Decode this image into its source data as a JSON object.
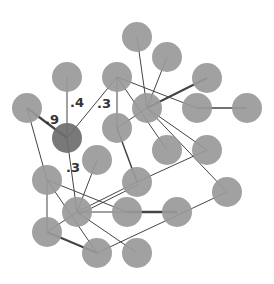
{
  "graph": {
    "node_radius": 15,
    "colors": {
      "node": "#999999",
      "highlight_node": "#6e6e6e",
      "edge": "#444444",
      "label": "#333333"
    },
    "nodes": [
      {
        "id": "n1",
        "x": 137,
        "y": 37
      },
      {
        "id": "n2",
        "x": 167,
        "y": 57
      },
      {
        "id": "n3",
        "x": 207,
        "y": 78
      },
      {
        "id": "n4",
        "x": 67,
        "y": 77
      },
      {
        "id": "n5",
        "x": 117,
        "y": 77
      },
      {
        "id": "n6",
        "x": 27,
        "y": 108
      },
      {
        "id": "n7",
        "x": 147,
        "y": 108
      },
      {
        "id": "n8",
        "x": 197,
        "y": 108
      },
      {
        "id": "n9",
        "x": 247,
        "y": 108
      },
      {
        "id": "n10",
        "x": 67,
        "y": 138,
        "highlight": true
      },
      {
        "id": "n11",
        "x": 117,
        "y": 128
      },
      {
        "id": "n12",
        "x": 167,
        "y": 150
      },
      {
        "id": "n13",
        "x": 207,
        "y": 150
      },
      {
        "id": "n14",
        "x": 97,
        "y": 160
      },
      {
        "id": "n15",
        "x": 47,
        "y": 180
      },
      {
        "id": "n16",
        "x": 137,
        "y": 182
      },
      {
        "id": "n17",
        "x": 227,
        "y": 192
      },
      {
        "id": "n18",
        "x": 77,
        "y": 212
      },
      {
        "id": "n19",
        "x": 127,
        "y": 212
      },
      {
        "id": "n20",
        "x": 177,
        "y": 212
      },
      {
        "id": "n21",
        "x": 47,
        "y": 232
      },
      {
        "id": "n22",
        "x": 97,
        "y": 253
      },
      {
        "id": "n23",
        "x": 137,
        "y": 253
      }
    ],
    "edges": [
      {
        "from": "n6",
        "to": "n10",
        "width": 2.2,
        "label": ".9",
        "lx": 45,
        "ly": 124
      },
      {
        "from": "n4",
        "to": "n10",
        "width": 1,
        "label": ".4",
        "lx": 70,
        "ly": 107
      },
      {
        "from": "n5",
        "to": "n10",
        "width": 1,
        "label": ".3",
        "lx": 97,
        "ly": 108
      },
      {
        "from": "n10",
        "to": "n18",
        "width": 1,
        "label": ".3",
        "lx": 66,
        "ly": 172
      },
      {
        "from": "n6",
        "to": "n15",
        "width": 1
      },
      {
        "from": "n5",
        "to": "n11",
        "width": 1
      },
      {
        "from": "n5",
        "to": "n12",
        "width": 1
      },
      {
        "from": "n5",
        "to": "n8",
        "width": 1
      },
      {
        "from": "n1",
        "to": "n7",
        "width": 1
      },
      {
        "from": "n2",
        "to": "n7",
        "width": 1
      },
      {
        "from": "n3",
        "to": "n7",
        "width": 2
      },
      {
        "from": "n7",
        "to": "n11",
        "width": 1
      },
      {
        "from": "n7",
        "to": "n13",
        "width": 1
      },
      {
        "from": "n7",
        "to": "n17",
        "width": 1
      },
      {
        "from": "n8",
        "to": "n9",
        "width": 1.5
      },
      {
        "from": "n11",
        "to": "n16",
        "width": 1.5
      },
      {
        "from": "n14",
        "to": "n18",
        "width": 1
      },
      {
        "from": "n15",
        "to": "n19",
        "width": 1
      },
      {
        "from": "n15",
        "to": "n21",
        "width": 1
      },
      {
        "from": "n15",
        "to": "n22",
        "width": 1
      },
      {
        "from": "n18",
        "to": "n16",
        "width": 1
      },
      {
        "from": "n18",
        "to": "n16",
        "width": 1,
        "offset": 3
      },
      {
        "from": "n18",
        "to": "n20",
        "width": 1
      },
      {
        "from": "n18",
        "to": "n21",
        "width": 1
      },
      {
        "from": "n18",
        "to": "n23",
        "width": 1
      },
      {
        "from": "n19",
        "to": "n20",
        "width": 2.5
      },
      {
        "from": "n16",
        "to": "n13",
        "width": 1
      },
      {
        "from": "n21",
        "to": "n22",
        "width": 2
      },
      {
        "from": "n22",
        "to": "n17",
        "width": 1
      }
    ]
  }
}
